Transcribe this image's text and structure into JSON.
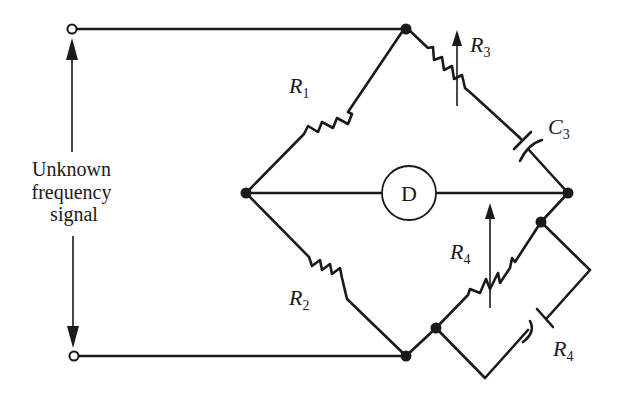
{
  "diagram": {
    "type": "AC bridge circuit (Wien bridge for frequency measurement)",
    "signal_label": [
      "Unknown",
      "frequency",
      "signal"
    ],
    "detector": {
      "label": "D"
    },
    "components": [
      {
        "id": "R1",
        "symbol": "R",
        "subscript": "1",
        "kind": "fixed-resistor",
        "arm": "left-top"
      },
      {
        "id": "R2",
        "symbol": "R",
        "subscript": "2",
        "kind": "fixed-resistor",
        "arm": "left-bottom"
      },
      {
        "id": "R3",
        "symbol": "R",
        "subscript": "3",
        "kind": "variable-resistor",
        "arm": "right-top",
        "series_with": "C3"
      },
      {
        "id": "C3",
        "symbol": "C",
        "subscript": "3",
        "kind": "capacitor",
        "arm": "right-top"
      },
      {
        "id": "R4_var",
        "symbol": "R",
        "subscript": "4",
        "kind": "variable-resistor",
        "arm": "right-bottom",
        "parallel_with": "R4_cap"
      },
      {
        "id": "R4_cap",
        "symbol": "R",
        "subscript": "4",
        "kind": "capacitor",
        "arm": "right-bottom"
      }
    ],
    "colors": {
      "ink": "#1a1a1a",
      "background": "#ffffff"
    }
  }
}
